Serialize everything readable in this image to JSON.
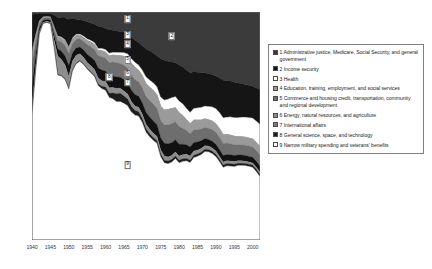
{
  "chart_data": {
    "type": "area",
    "title": "",
    "subtitle": "",
    "xlabel": "",
    "ylabel": "",
    "stacked": true,
    "normalized": true,
    "grid": false,
    "legend_position": "right",
    "xlim": [
      1940,
      2002
    ],
    "ylim": [
      0,
      100
    ],
    "x_tick_labels": [
      "1940",
      "1945",
      "1950",
      "1955",
      "1960",
      "1965",
      "1970",
      "1975",
      "1980",
      "1985",
      "1990",
      "1995",
      "2000"
    ],
    "x_tick_values": [
      1940,
      1945,
      1950,
      1955,
      1960,
      1965,
      1970,
      1975,
      1980,
      1985,
      1990,
      1995,
      2000
    ],
    "y_tick_labels": [
      "0%",
      "10%",
      "20%",
      "30%",
      "40%",
      "50%",
      "60%",
      "70%",
      "80%",
      "90%",
      "100%"
    ],
    "y_tick_values": [
      0,
      10,
      20,
      30,
      40,
      50,
      60,
      70,
      80,
      90,
      100
    ],
    "x": [
      1940,
      1941,
      1942,
      1943,
      1944,
      1945,
      1946,
      1947,
      1948,
      1949,
      1950,
      1951,
      1952,
      1953,
      1954,
      1955,
      1956,
      1957,
      1958,
      1959,
      1960,
      1961,
      1962,
      1963,
      1964,
      1965,
      1966,
      1967,
      1968,
      1969,
      1970,
      1971,
      1972,
      1973,
      1974,
      1975,
      1976,
      1977,
      1978,
      1979,
      1980,
      1981,
      1982,
      1983,
      1984,
      1985,
      1986,
      1987,
      1988,
      1989,
      1990,
      1991,
      1992,
      1993,
      1994,
      1995,
      1996,
      1997,
      1998,
      1999,
      2000,
      2001,
      2002
    ],
    "series": [
      {
        "name": "1 Administrative justice, Medicare, Social Security, and general government",
        "key": "1",
        "color": "#3b3b3b",
        "values": [
          1.0,
          0.9,
          0.6,
          0.5,
          0.5,
          0.5,
          1.3,
          2.4,
          2.6,
          2.6,
          3.2,
          3.0,
          3.2,
          3.4,
          3.7,
          4.3,
          4.8,
          5.4,
          6.3,
          6.5,
          7.2,
          7.8,
          8.0,
          8.3,
          8.5,
          8.8,
          9.5,
          11.0,
          12.4,
          13.4,
          14.8,
          16.2,
          17.0,
          18.0,
          19.2,
          20.5,
          21.2,
          21.6,
          21.9,
          22.4,
          23.2,
          24.0,
          25.4,
          26.6,
          26.2,
          26.4,
          26.8,
          27.2,
          27.6,
          28.0,
          28.6,
          29.4,
          30.2,
          30.6,
          30.9,
          31.4,
          31.8,
          32.0,
          32.4,
          32.8,
          33.2,
          34.0,
          34.6
        ]
      },
      {
        "name": "2 Income security",
        "key": "2",
        "color": "#151515",
        "values": [
          16.0,
          9.0,
          3.2,
          1.6,
          1.4,
          1.6,
          5.0,
          8.0,
          8.4,
          9.6,
          12.0,
          8.4,
          6.6,
          6.2,
          6.8,
          7.4,
          7.6,
          8.0,
          9.6,
          9.4,
          9.2,
          10.2,
          9.6,
          9.4,
          9.2,
          9.0,
          8.8,
          9.4,
          9.6,
          9.8,
          10.6,
          12.2,
          12.8,
          13.0,
          13.6,
          16.8,
          17.4,
          16.6,
          15.6,
          15.0,
          15.8,
          16.2,
          16.8,
          17.4,
          16.0,
          15.6,
          15.4,
          14.8,
          14.6,
          14.4,
          14.6,
          15.6,
          16.6,
          16.4,
          16.0,
          15.8,
          15.4,
          15.0,
          14.6,
          14.4,
          14.2,
          14.8,
          15.6
        ]
      },
      {
        "name": "3 Health",
        "key": "3",
        "color": "#ffffff",
        "values": [
          0.5,
          0.3,
          0.1,
          0.1,
          0.1,
          0.1,
          0.3,
          0.5,
          0.5,
          0.6,
          0.7,
          0.6,
          0.6,
          0.6,
          0.7,
          0.8,
          0.8,
          0.9,
          1.0,
          1.1,
          1.2,
          1.3,
          1.3,
          1.4,
          1.5,
          1.6,
          1.7,
          2.0,
          2.2,
          2.4,
          2.6,
          3.0,
          3.2,
          3.4,
          3.6,
          4.0,
          4.4,
          4.6,
          4.8,
          5.0,
          5.2,
          5.2,
          5.0,
          5.0,
          5.2,
          5.4,
          5.6,
          5.8,
          6.0,
          6.4,
          6.8,
          7.2,
          7.6,
          7.8,
          8.2,
          8.4,
          8.6,
          8.8,
          9.0,
          9.2,
          9.4,
          9.6,
          10.0
        ]
      },
      {
        "name": "4 Education, training, employment, and social services",
        "key": "4",
        "color": "#9a9a9a",
        "values": [
          5.0,
          3.0,
          1.0,
          0.5,
          0.4,
          0.4,
          1.0,
          1.6,
          1.7,
          1.9,
          2.2,
          1.8,
          1.6,
          1.5,
          1.6,
          1.8,
          2.0,
          2.1,
          2.3,
          2.6,
          2.7,
          2.9,
          3.0,
          3.2,
          3.4,
          4.0,
          4.6,
          5.2,
          5.4,
          5.0,
          5.2,
          5.6,
          5.8,
          6.0,
          5.8,
          6.2,
          6.6,
          6.8,
          6.6,
          6.2,
          6.0,
          5.6,
          4.8,
          4.4,
          4.2,
          4.2,
          4.0,
          3.8,
          3.8,
          3.8,
          3.8,
          3.8,
          3.8,
          3.8,
          3.8,
          3.8,
          3.6,
          3.6,
          3.6,
          3.6,
          3.6,
          3.6,
          3.8
        ]
      },
      {
        "name": "5 Commerce and housing credit, transportation, community and regional development",
        "key": "5",
        "color": "#6e6e6e",
        "values": [
          10.0,
          5.5,
          2.0,
          1.0,
          0.9,
          1.0,
          2.4,
          3.6,
          4.0,
          4.6,
          5.4,
          4.2,
          3.8,
          3.6,
          3.8,
          4.2,
          4.6,
          4.8,
          5.4,
          5.8,
          5.6,
          6.0,
          6.2,
          6.2,
          6.0,
          6.2,
          6.4,
          6.6,
          6.6,
          6.4,
          6.6,
          7.0,
          7.2,
          7.4,
          7.2,
          7.6,
          8.0,
          8.2,
          8.4,
          8.0,
          7.8,
          7.0,
          6.2,
          5.8,
          5.6,
          5.4,
          5.2,
          5.0,
          5.0,
          5.2,
          5.4,
          5.6,
          5.4,
          5.2,
          5.0,
          4.8,
          4.6,
          4.6,
          4.6,
          4.6,
          4.6,
          4.8,
          5.0
        ]
      },
      {
        "name": "6 Energy, natural resources,  and agriculture",
        "key": "6",
        "color": "#111111",
        "values": [
          9.0,
          5.0,
          1.8,
          0.9,
          0.8,
          0.9,
          2.2,
          3.2,
          3.6,
          4.0,
          4.8,
          3.6,
          3.2,
          3.0,
          3.2,
          3.6,
          3.8,
          4.0,
          4.4,
          4.8,
          4.6,
          5.0,
          5.0,
          5.0,
          4.8,
          5.0,
          5.0,
          5.0,
          5.0,
          4.8,
          5.0,
          5.2,
          5.4,
          5.4,
          5.2,
          5.4,
          5.6,
          5.8,
          5.6,
          5.4,
          5.2,
          4.6,
          4.2,
          4.0,
          3.8,
          3.6,
          3.4,
          3.2,
          3.0,
          3.0,
          3.0,
          3.0,
          2.9,
          2.8,
          2.8,
          2.7,
          2.6,
          2.6,
          2.6,
          2.5,
          2.5,
          2.6,
          2.7
        ]
      },
      {
        "name": "7 International affairs",
        "key": "7",
        "color": "#8d8d8d",
        "values": [
          3.0,
          2.0,
          0.8,
          0.4,
          0.4,
          0.5,
          3.0,
          8.0,
          7.0,
          6.0,
          5.0,
          4.0,
          3.4,
          3.0,
          2.8,
          2.6,
          2.6,
          2.6,
          2.6,
          2.4,
          2.4,
          2.4,
          2.4,
          2.4,
          2.2,
          2.2,
          2.2,
          2.2,
          2.0,
          2.0,
          2.0,
          2.0,
          2.0,
          1.9,
          1.9,
          1.8,
          1.8,
          1.8,
          1.8,
          1.8,
          1.8,
          1.8,
          1.8,
          1.8,
          1.8,
          1.7,
          1.7,
          1.6,
          1.5,
          1.5,
          1.4,
          1.3,
          1.3,
          1.2,
          1.2,
          1.2,
          1.1,
          1.1,
          1.0,
          1.0,
          1.0,
          1.0,
          1.0
        ]
      },
      {
        "name": "8 General science, space, and technology",
        "key": "8",
        "color": "#1d1d1d",
        "values": [
          0.4,
          0.3,
          0.1,
          0.1,
          0.1,
          0.1,
          0.2,
          0.3,
          0.3,
          0.3,
          0.4,
          0.3,
          0.3,
          0.3,
          0.3,
          0.3,
          0.4,
          0.5,
          0.6,
          1.0,
          1.4,
          1.8,
          2.6,
          3.4,
          3.6,
          3.2,
          2.8,
          2.4,
          2.0,
          1.8,
          1.6,
          1.4,
          1.3,
          1.2,
          1.1,
          1.1,
          1.1,
          1.1,
          1.1,
          1.1,
          1.1,
          1.1,
          1.0,
          1.0,
          1.0,
          1.0,
          1.0,
          1.0,
          1.0,
          1.0,
          1.0,
          1.0,
          1.0,
          1.0,
          1.0,
          1.0,
          0.9,
          0.9,
          0.9,
          0.9,
          0.9,
          0.9,
          0.9
        ]
      },
      {
        "name": "9 Narrow military spending and veterans' benefits",
        "key": "9",
        "color": "#ffffff",
        "values": [
          55.1,
          74.0,
          90.4,
          95.0,
          95.4,
          94.9,
          84.6,
          72.4,
          71.9,
          70.4,
          66.3,
          74.1,
          77.3,
          78.4,
          77.1,
          75.0,
          73.4,
          71.7,
          67.8,
          66.4,
          65.7,
          62.6,
          61.9,
          60.7,
          60.8,
          60.0,
          59.0,
          56.2,
          54.8,
          54.4,
          51.6,
          47.4,
          45.3,
          43.7,
          42.4,
          36.6,
          33.9,
          33.5,
          34.2,
          36.1,
          33.9,
          34.5,
          34.8,
          34.0,
          36.2,
          36.7,
          37.8,
          39.6,
          39.5,
          38.7,
          37.4,
          35.1,
          32.2,
          33.2,
          33.1,
          32.9,
          33.4,
          33.4,
          33.3,
          33.0,
          32.6,
          30.7,
          28.4
        ]
      }
    ],
    "callouts": [
      {
        "label": "1",
        "x": 1966,
        "y": 97.0
      },
      {
        "label": "2",
        "x": 1978,
        "y": 89.5
      },
      {
        "label": "3",
        "x": 1966,
        "y": 90.0
      },
      {
        "label": "4",
        "x": 1966,
        "y": 86.0
      },
      {
        "label": "5",
        "x": 1966,
        "y": 79.0
      },
      {
        "label": "6",
        "x": 1966,
        "y": 73.0
      },
      {
        "label": "7",
        "x": 1966,
        "y": 69.0
      },
      {
        "label": "8",
        "x": 1961,
        "y": 71.5
      },
      {
        "label": "9",
        "x": 1966,
        "y": 33.0
      }
    ]
  },
  "legend": {
    "items": [
      {
        "swatch": "#3b3b3b",
        "label": "1 Administrative justice, Medicare, Social Security, and general government"
      },
      {
        "swatch": "#151515",
        "label": "2 Income security"
      },
      {
        "swatch": "#ffffff",
        "label": "3 Health"
      },
      {
        "swatch": "#9a9a9a",
        "label": "4 Education, training, employment, and social services"
      },
      {
        "swatch": "#6e6e6e",
        "label": "5 Commerce and housing credit, transportation, community and regional development"
      },
      {
        "swatch": "#8d8d8d",
        "label": "6 Energy, natural resources,  and agriculture"
      },
      {
        "swatch": "#7c7c7c",
        "label": "7 International affairs"
      },
      {
        "swatch": "#1d1d1d",
        "label": "8 General science, space, and technology"
      },
      {
        "swatch": "#ffffff",
        "label": "9 Narrow military spending and veterans' benefits"
      }
    ]
  },
  "axes": {
    "axis_color": "#555555"
  }
}
